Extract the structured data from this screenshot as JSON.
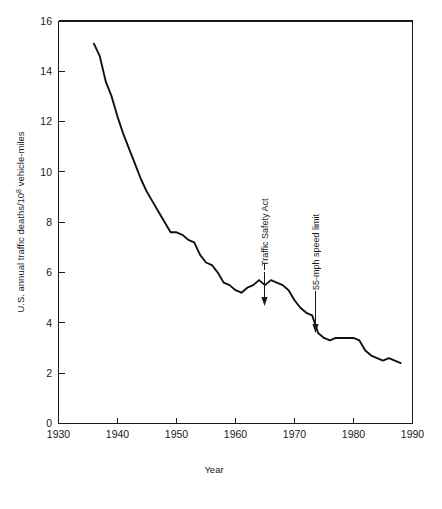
{
  "chart_data": {
    "type": "line",
    "title": "",
    "xlabel": "Year",
    "ylabel": "U.S. annual traffic deaths/10⁸ vehicle-miles",
    "ylabel_parts": {
      "before": "U.S. annual traffic deaths/10",
      "superscript": "8",
      "after": " vehicle-miles"
    },
    "xlim": [
      1930,
      1990
    ],
    "ylim": [
      0,
      16
    ],
    "xticks": [
      1930,
      1940,
      1950,
      1960,
      1970,
      1980,
      1990
    ],
    "xtick_labels": [
      "1930",
      "1940",
      "1950",
      "1960",
      "1970",
      "1980",
      "1990"
    ],
    "yticks": [
      0,
      2,
      4,
      6,
      8,
      10,
      12,
      14,
      16
    ],
    "ytick_labels": [
      "0",
      "2",
      "4",
      "6",
      "8",
      "10",
      "12",
      "14",
      "16"
    ],
    "grid": false,
    "legend": false,
    "line_color": "#111111",
    "series": [
      {
        "name": "U.S. annual traffic deaths per 10^8 vehicle-miles",
        "x": [
          1936,
          1937,
          1938,
          1939,
          1940,
          1941,
          1942,
          1943,
          1944,
          1945,
          1946,
          1947,
          1948,
          1949,
          1950,
          1951,
          1952,
          1953,
          1954,
          1955,
          1956,
          1957,
          1958,
          1959,
          1960,
          1961,
          1962,
          1963,
          1964,
          1965,
          1966,
          1967,
          1968,
          1969,
          1970,
          1971,
          1972,
          1973,
          1974,
          1975,
          1976,
          1977,
          1978,
          1979,
          1980,
          1981,
          1982,
          1983,
          1984,
          1985,
          1986,
          1987,
          1988
        ],
        "y": [
          15.1,
          14.6,
          13.6,
          13.0,
          12.2,
          11.5,
          10.9,
          10.3,
          9.7,
          9.2,
          8.8,
          8.4,
          8.0,
          7.6,
          7.6,
          7.5,
          7.3,
          7.2,
          6.7,
          6.4,
          6.3,
          6.0,
          5.6,
          5.5,
          5.3,
          5.2,
          5.4,
          5.5,
          5.7,
          5.5,
          5.7,
          5.6,
          5.5,
          5.3,
          4.9,
          4.6,
          4.4,
          4.3,
          3.6,
          3.4,
          3.3,
          3.4,
          3.4,
          3.4,
          3.4,
          3.3,
          2.9,
          2.7,
          2.6,
          2.5,
          2.6,
          2.5,
          2.4
        ]
      }
    ],
    "annotations": [
      {
        "label": "Traffic Safety Act",
        "x": 1966,
        "y": 5.7,
        "rotation": -90,
        "arrow": "down"
      },
      {
        "label": "55-mph speed limit",
        "x": 1973,
        "y": 4.3,
        "rotation": -90,
        "arrow": "down"
      }
    ]
  }
}
